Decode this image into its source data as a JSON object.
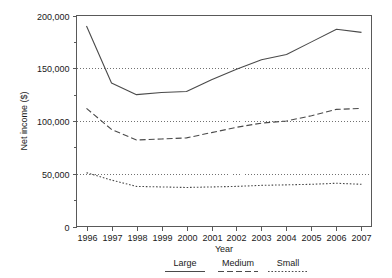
{
  "chart_data": {
    "type": "line",
    "title": "",
    "subtitle": "",
    "xlabel": "Year",
    "ylabel": "Net income ($)",
    "x": [
      1996,
      1997,
      1998,
      1999,
      2000,
      2001,
      2002,
      2003,
      2004,
      2005,
      2006,
      2007
    ],
    "xtick_labels": [
      "1996",
      "1997",
      "1998",
      "1999",
      "2000",
      "2001",
      "2002",
      "2003",
      "2004",
      "2005",
      "2006",
      "2007"
    ],
    "ytick_labels": [
      "0",
      "50,000",
      "100,000",
      "150,000",
      "200,000"
    ],
    "ytick_values": [
      0,
      50000,
      100000,
      150000,
      200000
    ],
    "xlim": [
      1995.6,
      2007.4
    ],
    "ylim": [
      0,
      200000
    ],
    "grid": "horizontal-dotted",
    "legend_position": "bottom",
    "series": [
      {
        "name": "Large",
        "style": "solid",
        "color": "#4a4a4a",
        "values": [
          190000,
          136000,
          125000,
          127000,
          128000,
          139000,
          149000,
          158000,
          163000,
          175000,
          187000,
          184000
        ]
      },
      {
        "name": "Medium",
        "style": "dashed",
        "color": "#4a4a4a",
        "values": [
          112000,
          92000,
          82000,
          83000,
          84000,
          89000,
          94000,
          98000,
          100000,
          105000,
          111000,
          112000
        ]
      },
      {
        "name": "Small",
        "style": "dotted",
        "color": "#4a4a4a",
        "values": [
          51000,
          44000,
          38000,
          37500,
          37000,
          37500,
          38000,
          39000,
          39500,
          40000,
          41000,
          40000
        ]
      }
    ]
  },
  "legend": {
    "items": [
      {
        "label": "Large",
        "style": "solid"
      },
      {
        "label": "Medium",
        "style": "dashed"
      },
      {
        "label": "Small",
        "style": "dotted"
      }
    ]
  },
  "axes": {
    "x_title": "Year",
    "y_title": "Net income ($)"
  }
}
